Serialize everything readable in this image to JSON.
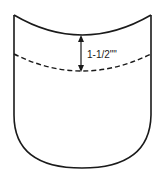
{
  "diagram": {
    "type": "sewing-pattern-pocket",
    "measurement_label": "1-1/2\"\"",
    "colors": {
      "stroke": "#1a1a1a",
      "background": "#ffffff"
    }
  }
}
